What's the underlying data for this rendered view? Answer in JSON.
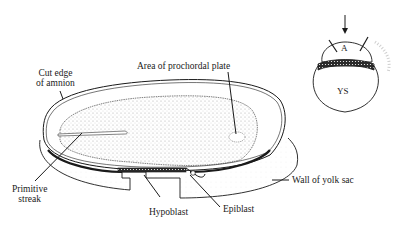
{
  "figure": {
    "type": "embryo-disc-illustration",
    "labels": {
      "cut_edge_line1": "Cut edge",
      "cut_edge_line2": "of amnion",
      "prochordal": "Area of prochordal plate",
      "primitive_line1": "Primitive",
      "primitive_line2": "streak",
      "hypoblast": "Hypoblast",
      "epiblast": "Epiblast",
      "yolk_wall": "Wall of yolk sac"
    },
    "inset": {
      "amnion_label": "A",
      "yolk_sac_label": "YS"
    },
    "colors": {
      "ink": "#1a1a1a",
      "stipple": "#bdbdbd",
      "background": "#ffffff"
    }
  }
}
